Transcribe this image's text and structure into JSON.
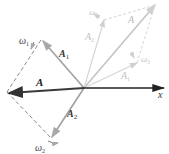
{
  "diagram": {
    "colors": {
      "main_vector": "#3a3a3a",
      "component_dark": "#9a9a9a",
      "ghost": "#cfcfcf",
      "dashed": "#8a8a8a",
      "axis": "#222222"
    },
    "axis": {
      "label": "x"
    },
    "labels": {
      "A_main": "A",
      "A1_main": "A",
      "A1_sub": "1",
      "A2_main": "A",
      "A2_sub": "2",
      "omega1": "ω",
      "omega1_sub": "1",
      "omega2": "ω",
      "omega2_sub": "2",
      "ghost_A": "A",
      "ghost_A1": "A",
      "ghost_A1_sub": "1",
      "ghost_A2": "A",
      "ghost_A2_sub": "2",
      "ghost_omega1": "ω",
      "ghost_omega1_sub": "1",
      "ghost_omega2": "ω",
      "ghost_omega2_sub": "2"
    }
  }
}
